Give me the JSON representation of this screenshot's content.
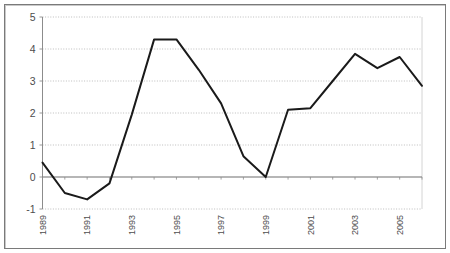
{
  "chart_data": {
    "type": "line",
    "title": "",
    "subtitle": "",
    "xlabel": "",
    "ylabel": "",
    "grid": true,
    "legend": false,
    "legend_position": "none",
    "xlim": [
      1989,
      2006
    ],
    "ylim": [
      -1,
      5
    ],
    "yticks": [
      -1,
      0,
      1,
      2,
      3,
      4,
      5
    ],
    "ytick_labels": [
      "-1",
      "0",
      "1",
      "2",
      "3",
      "4",
      "5"
    ],
    "xticks": [
      1989,
      1991,
      1993,
      1995,
      1997,
      1999,
      2001,
      2003,
      2005
    ],
    "xtick_labels": [
      "1989",
      "1991",
      "1993",
      "1995",
      "1997",
      "1999",
      "2001",
      "2003",
      "2005"
    ],
    "xtick_rotation": 90,
    "x": [
      1989,
      1990,
      1991,
      1992,
      1993,
      1994,
      1995,
      1996,
      1997,
      1998,
      1999,
      2000,
      2001,
      2002,
      2003,
      2004,
      2005,
      2006
    ],
    "values": [
      0.45,
      -0.5,
      -0.7,
      -0.2,
      1.95,
      4.3,
      4.3,
      3.35,
      2.3,
      0.65,
      0.0,
      2.1,
      2.15,
      3.0,
      3.85,
      3.4,
      3.75,
      2.85
    ],
    "series": [
      {
        "name": "series-1",
        "color": "#1a1a1a",
        "line_width": 2,
        "values": [
          0.45,
          -0.5,
          -0.7,
          -0.2,
          1.95,
          4.3,
          4.3,
          3.35,
          2.3,
          0.65,
          0.0,
          2.1,
          2.15,
          3.0,
          3.85,
          3.4,
          3.75,
          2.85
        ]
      }
    ],
    "zero_line": 0,
    "colors": {
      "line": "#1a1a1a",
      "grid": "#b5b5b5",
      "axis": "#8c8c8c",
      "zero_axis": "#6e6e6e",
      "frame": "#7a7a7a",
      "background": "#ffffff",
      "tick_label": "#4d4d4d"
    }
  }
}
